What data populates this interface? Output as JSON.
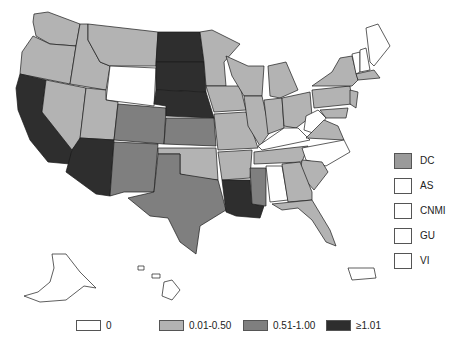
{
  "legend": {
    "items": [
      {
        "label": "0",
        "color": "#ffffff"
      },
      {
        "label": "0.01-0.50",
        "color": "#b3b3b3"
      },
      {
        "label": "0.51-1.00",
        "color": "#7f7f7f"
      },
      {
        "label": "≥1.01",
        "color": "#2e2e2e"
      }
    ]
  },
  "territories": [
    {
      "label": "DC",
      "category": "0.51-1.00",
      "color": "#9a9a9a"
    },
    {
      "label": "AS",
      "category": "0",
      "color": "#ffffff"
    },
    {
      "label": "CNMI",
      "category": "0",
      "color": "#ffffff"
    },
    {
      "label": "GU",
      "category": "0",
      "color": "#ffffff"
    },
    {
      "label": "VI",
      "category": "0",
      "color": "#ffffff"
    }
  ],
  "states": {
    "zero": [
      "WY",
      "KY",
      "WV",
      "NC",
      "AL",
      "VT",
      "NH",
      "ME",
      "AK",
      "HI",
      "PR"
    ],
    "low": [
      "WA",
      "OR",
      "ID",
      "MT",
      "NV",
      "UT",
      "MN",
      "IA",
      "WI",
      "IL",
      "MI",
      "IN",
      "OH",
      "PA",
      "NY",
      "MO",
      "AR",
      "OK",
      "TN",
      "VA",
      "SC",
      "GA",
      "FL",
      "MA",
      "NJ",
      "DE",
      "MD",
      "CT",
      "RI"
    ],
    "mid": [
      "CO",
      "KS",
      "NM",
      "TX",
      "MS"
    ],
    "high": [
      "CA",
      "AZ",
      "ND",
      "SD",
      "NE",
      "LA"
    ]
  }
}
